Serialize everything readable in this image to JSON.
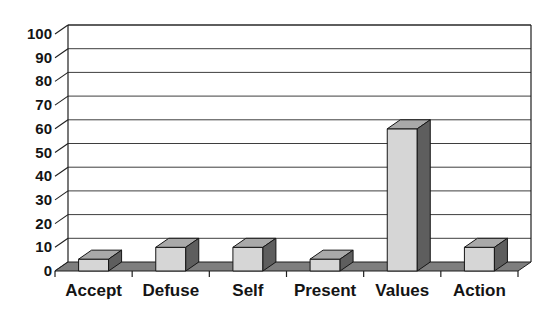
{
  "chart_data": {
    "type": "bar",
    "projection": "3d",
    "title": "",
    "xlabel": "",
    "ylabel": "",
    "categories": [
      "Accept",
      "Defuse",
      "Self",
      "Present",
      "Values",
      "Action"
    ],
    "values": [
      5,
      10,
      10,
      5,
      60,
      10
    ],
    "ylim": [
      0,
      100
    ],
    "ytick_step": 10,
    "ytick_labels": [
      "0",
      "10",
      "20",
      "30",
      "40",
      "50",
      "60",
      "70",
      "80",
      "90",
      "100"
    ],
    "grid": true,
    "legend": "none",
    "colors": {
      "background": "#ffffff",
      "wall": "#ffffff",
      "gridline": "#3e3e3e",
      "axis_outline": "#1f1f1f",
      "floor": "#7e7e7e",
      "bar_front": "#d6d6d6",
      "bar_top": "#a9a9a9",
      "bar_side": "#5e5e5e",
      "bar_outline": "#161616",
      "text": "#141414"
    }
  }
}
